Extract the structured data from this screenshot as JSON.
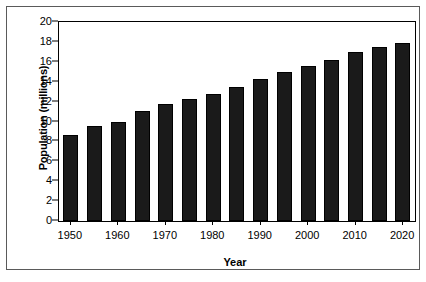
{
  "chart_data": {
    "type": "bar",
    "title": "",
    "xlabel": "Year",
    "ylabel": "Population (millions)",
    "categories": [
      "1950",
      "1955",
      "1960",
      "1965",
      "1970",
      "1975",
      "1980",
      "1985",
      "1990",
      "1995",
      "2000",
      "2005",
      "2010",
      "2015",
      "2020"
    ],
    "values": [
      8.6,
      9.5,
      10.0,
      11.1,
      11.8,
      12.3,
      12.8,
      13.5,
      14.3,
      15.0,
      15.6,
      16.2,
      17.0,
      17.5,
      17.9
    ],
    "series": [
      {
        "name": "Population",
        "values": [
          8.6,
          9.5,
          10.0,
          11.1,
          11.8,
          12.3,
          12.8,
          13.5,
          14.3,
          15.0,
          15.6,
          16.2,
          17.0,
          17.5,
          17.9
        ]
      }
    ],
    "ylim": [
      0,
      20
    ],
    "yticks": [
      0,
      2,
      4,
      6,
      8,
      10,
      12,
      14,
      16,
      18,
      20
    ],
    "ytick_labels": [
      "0",
      "2",
      "4",
      "6",
      "8",
      "10",
      "12",
      "14",
      "16",
      "18",
      "20"
    ],
    "xtick_labels": [
      "1950",
      "1960",
      "1970",
      "1980",
      "1990",
      "2000",
      "2010",
      "2020"
    ],
    "xtick_categories": [
      "1950",
      "1960",
      "1970",
      "1980",
      "1990",
      "2000",
      "2010",
      "2020"
    ],
    "grid": false,
    "legend": false,
    "legend_position": "none",
    "bar_color": "#1a1a1a",
    "bar_edge_color": "#000000",
    "axis_color": "#000000",
    "frame_color": "#5a5a5a",
    "background_color": "#ffffff"
  }
}
